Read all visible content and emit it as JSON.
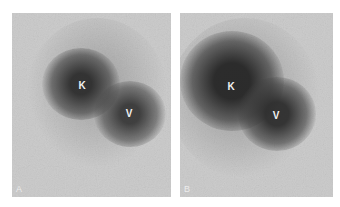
{
  "figure": {
    "background_color": "#c9c9c9",
    "blob_color": "#3a3a3a",
    "panels": [
      {
        "id": "A",
        "label": "A",
        "labels": [
          {
            "text": "K",
            "x": 70,
            "y": 72
          },
          {
            "text": "V",
            "x": 117,
            "y": 100
          }
        ]
      },
      {
        "id": "B",
        "label": "B",
        "labels": [
          {
            "text": "K",
            "x": 51,
            "y": 73
          },
          {
            "text": "V",
            "x": 96,
            "y": 102
          }
        ]
      }
    ]
  }
}
